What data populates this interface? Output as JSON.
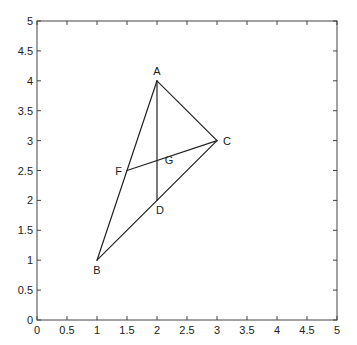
{
  "diagram": {
    "type": "geometry-plot",
    "axes": {
      "xlim": [
        0,
        5
      ],
      "ylim": [
        0,
        5
      ],
      "x_ticks": [
        "0",
        "0.5",
        "1",
        "1.5",
        "2",
        "2.5",
        "3",
        "3.5",
        "4",
        "4.5",
        "5"
      ],
      "y_ticks": [
        "0",
        "0.5",
        "1",
        "1.5",
        "2",
        "2.5",
        "3",
        "3.5",
        "4",
        "4.5",
        "5"
      ],
      "x_tick_values": [
        0,
        0.5,
        1,
        1.5,
        2,
        2.5,
        3,
        3.5,
        4,
        4.5,
        5
      ],
      "y_tick_values": [
        0,
        0.5,
        1,
        1.5,
        2,
        2.5,
        3,
        3.5,
        4,
        4.5,
        5
      ],
      "grid": false,
      "box": true,
      "tick_direction": "in"
    },
    "points": [
      {
        "name": "A",
        "x": 2,
        "y": 4,
        "label_dx": 0,
        "label_dy": -6,
        "anchor": "middle"
      },
      {
        "name": "B",
        "x": 1,
        "y": 1,
        "label_dx": 0,
        "label_dy": 14,
        "anchor": "middle"
      },
      {
        "name": "C",
        "x": 3,
        "y": 3,
        "label_dx": 6,
        "label_dy": 4,
        "anchor": "start"
      },
      {
        "name": "D",
        "x": 2,
        "y": 2,
        "label_dx": 3,
        "label_dy": 14,
        "anchor": "middle"
      },
      {
        "name": "F",
        "x": 1.5,
        "y": 2.5,
        "label_dx": -5,
        "label_dy": 4,
        "anchor": "end"
      },
      {
        "name": "G",
        "x": 2,
        "y": 2.6667,
        "label_dx": 12,
        "label_dy": 3,
        "anchor": "middle"
      }
    ],
    "segments": [
      {
        "from": "A",
        "to": "B"
      },
      {
        "from": "B",
        "to": "C"
      },
      {
        "from": "C",
        "to": "A"
      },
      {
        "from": "A",
        "to": "D"
      },
      {
        "from": "C",
        "to": "F"
      }
    ],
    "colors": {
      "line": "#222222",
      "axis": "#444444",
      "background": "#ffffff"
    }
  }
}
